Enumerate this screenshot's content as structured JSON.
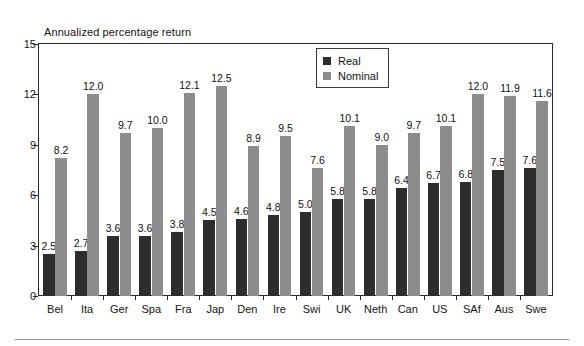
{
  "chart_data": {
    "type": "bar",
    "title": "Annualized percentage return",
    "xlabel": "",
    "ylabel": "Annualized percentage return",
    "ylim": [
      0,
      15
    ],
    "yticks": [
      0,
      3,
      6,
      9,
      12,
      15
    ],
    "grid": false,
    "legend_position": "top-center",
    "categories": [
      "Bel",
      "Ita",
      "Ger",
      "Spa",
      "Fra",
      "Jap",
      "Den",
      "Ire",
      "Swi",
      "UK",
      "Neth",
      "Can",
      "US",
      "SAf",
      "Aus",
      "Swe"
    ],
    "series": [
      {
        "name": "Real",
        "color": "#2d2d2d",
        "values": [
          2.5,
          2.7,
          3.6,
          3.6,
          3.8,
          4.5,
          4.6,
          4.8,
          5.0,
          5.8,
          5.8,
          6.4,
          6.7,
          6.8,
          7.5,
          7.6
        ],
        "labels": [
          "2.5",
          "2.7",
          "3.6",
          "3.6",
          "3.8",
          "4.5",
          "4.6",
          "4.8",
          "5.0",
          "5.8",
          "5.8",
          "6.4",
          "6.7",
          "6.8",
          "7.5",
          "7.6"
        ]
      },
      {
        "name": "Nominal",
        "color": "#8d8d8d",
        "values": [
          8.2,
          12.0,
          9.7,
          10.0,
          12.1,
          12.5,
          8.9,
          9.5,
          7.6,
          10.1,
          9.0,
          9.7,
          10.1,
          12.0,
          11.9,
          11.6
        ],
        "labels": [
          "8.2",
          "12.0",
          "9.7",
          "10.0",
          "12.1",
          "12.5",
          "8.9",
          "9.5",
          "7.6",
          "10.1",
          "9.0",
          "9.7",
          "10.1",
          "12.0",
          "11.9",
          "11.6"
        ]
      }
    ],
    "ytick_labels": [
      "0",
      "3",
      "6",
      "9",
      "12",
      "15"
    ]
  },
  "legend": {
    "entries": [
      {
        "label": "Real",
        "swatch": "real"
      },
      {
        "label": "Nominal",
        "swatch": "nominal"
      }
    ]
  }
}
